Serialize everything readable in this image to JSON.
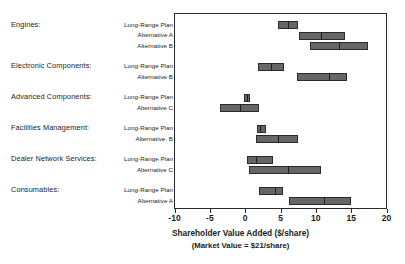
{
  "chart_data": {
    "type": "bar",
    "subtype": "floating-range-bar",
    "title": "Shareholder Value Added ($/share)",
    "subtitle": "(Market Value = $21/share)",
    "xlabel": "Shareholder Value Added ($/share)",
    "ylabel": "",
    "xlim": [
      -10,
      20
    ],
    "xticks": [
      -10,
      -5,
      0,
      5,
      10,
      15,
      20
    ],
    "xtick_labels": [
      "-10",
      "-5",
      "0",
      "5",
      "10",
      "15",
      "20"
    ],
    "grid": false,
    "legend": false,
    "bar_color": "#666666",
    "bar_edge_color": "#2b2b2b",
    "midline_color": "#1b1b1b",
    "groups": [
      {
        "category": "Engines:",
        "bars": [
          {
            "scenario": "Long-Range Plan",
            "low": 4.6,
            "mid": 6.1,
            "high": 7.5
          },
          {
            "scenario": "Alternative A",
            "low": 7.6,
            "mid": 10.7,
            "high": 14.1
          },
          {
            "scenario": "Alternative B",
            "low": 9.2,
            "mid": 13.3,
            "high": 17.4
          }
        ]
      },
      {
        "category": "Electronic Components:",
        "bars": [
          {
            "scenario": "Long-Range Plan",
            "low": 1.8,
            "mid": 3.7,
            "high": 5.5
          },
          {
            "scenario": "Alternative B",
            "low": 7.3,
            "mid": 11.8,
            "high": 14.4
          }
        ]
      },
      {
        "category": "Advanced Components:",
        "bars": [
          {
            "scenario": "Long-Range Plan",
            "low": -0.1,
            "mid": 0.3,
            "high": 0.7
          },
          {
            "scenario": "Alternative C",
            "low": -3.5,
            "mid": -0.7,
            "high": 2.0
          }
        ]
      },
      {
        "category": "Facilities Management:",
        "bars": [
          {
            "scenario": "Long-Range Plan",
            "low": 1.7,
            "mid": 2.1,
            "high": 3.0
          },
          {
            "scenario": "Alternative. B",
            "low": 1.5,
            "mid": 4.7,
            "high": 7.5
          }
        ]
      },
      {
        "category": "Dealer Network Services:",
        "bars": [
          {
            "scenario": "Long-Range Plan",
            "low": 0.2,
            "mid": 1.5,
            "high": 4.0
          },
          {
            "scenario": "Alternative C",
            "low": 0.5,
            "mid": 6.0,
            "high": 10.8
          }
        ]
      },
      {
        "category": "Consumables:",
        "bars": [
          {
            "scenario": "Long-Range Plan",
            "low": 1.9,
            "mid": 4.2,
            "high": 5.4
          },
          {
            "scenario": "Alternative A",
            "low": 6.2,
            "mid": 11.2,
            "high": 15.0
          }
        ]
      }
    ]
  }
}
